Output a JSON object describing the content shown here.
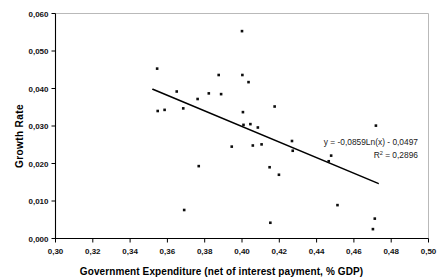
{
  "chart_data": {
    "type": "scatter",
    "title": "",
    "xlabel": "Government Expenditure (net of interest payment, % GDP)",
    "ylabel": "Growth Rate",
    "xlim": [
      0.3,
      0.5
    ],
    "ylim": [
      0.0,
      0.06
    ],
    "xticks": [
      0.3,
      0.32,
      0.34,
      0.36,
      0.38,
      0.4,
      0.42,
      0.44,
      0.46,
      0.48,
      0.5
    ],
    "yticks": [
      0.0,
      0.01,
      0.02,
      0.03,
      0.04,
      0.05,
      0.06
    ],
    "xtick_labels": [
      "0,30",
      "0,32",
      "0,34",
      "0,36",
      "0,38",
      "0,40",
      "0,42",
      "0,44",
      "0,46",
      "0,48",
      "0,50"
    ],
    "ytick_labels": [
      "0,000",
      "0,010",
      "0,020",
      "0,030",
      "0,040",
      "0,050",
      "0,060"
    ],
    "decimal_separator": ",",
    "grid": false,
    "legend": "none",
    "marker": "square",
    "marker_color": "#0d0d0d",
    "points": [
      {
        "x": 0.3545,
        "y": 0.0453
      },
      {
        "x": 0.3548,
        "y": 0.034
      },
      {
        "x": 0.3585,
        "y": 0.0343
      },
      {
        "x": 0.365,
        "y": 0.0392
      },
      {
        "x": 0.3685,
        "y": 0.0347
      },
      {
        "x": 0.369,
        "y": 0.0076
      },
      {
        "x": 0.3762,
        "y": 0.0372
      },
      {
        "x": 0.3768,
        "y": 0.0193
      },
      {
        "x": 0.3822,
        "y": 0.0387
      },
      {
        "x": 0.3875,
        "y": 0.0436
      },
      {
        "x": 0.3888,
        "y": 0.0385
      },
      {
        "x": 0.3945,
        "y": 0.0245
      },
      {
        "x": 0.4,
        "y": 0.0553
      },
      {
        "x": 0.4002,
        "y": 0.0436
      },
      {
        "x": 0.4005,
        "y": 0.0337
      },
      {
        "x": 0.4008,
        "y": 0.0303
      },
      {
        "x": 0.4035,
        "y": 0.0417
      },
      {
        "x": 0.4045,
        "y": 0.0305
      },
      {
        "x": 0.4058,
        "y": 0.0248
      },
      {
        "x": 0.4085,
        "y": 0.0296
      },
      {
        "x": 0.4105,
        "y": 0.0251
      },
      {
        "x": 0.4148,
        "y": 0.019
      },
      {
        "x": 0.4152,
        "y": 0.0042
      },
      {
        "x": 0.4175,
        "y": 0.0352
      },
      {
        "x": 0.4198,
        "y": 0.017
      },
      {
        "x": 0.4268,
        "y": 0.026
      },
      {
        "x": 0.4272,
        "y": 0.0234
      },
      {
        "x": 0.4465,
        "y": 0.0206
      },
      {
        "x": 0.4478,
        "y": 0.0221
      },
      {
        "x": 0.4512,
        "y": 0.0089
      },
      {
        "x": 0.4702,
        "y": 0.0025
      },
      {
        "x": 0.4712,
        "y": 0.0053
      },
      {
        "x": 0.4718,
        "y": 0.0301
      }
    ],
    "trendline": {
      "kind": "logarithmic",
      "equation": "y = -0,0859Ln(x) - 0,0497",
      "r_squared_label": "R",
      "r_squared_sup": "2",
      "r_squared_value": "= 0,2896",
      "x_start": 0.3522,
      "y_start": 0.0398,
      "x_end": 0.473,
      "y_end": 0.0147
    }
  }
}
